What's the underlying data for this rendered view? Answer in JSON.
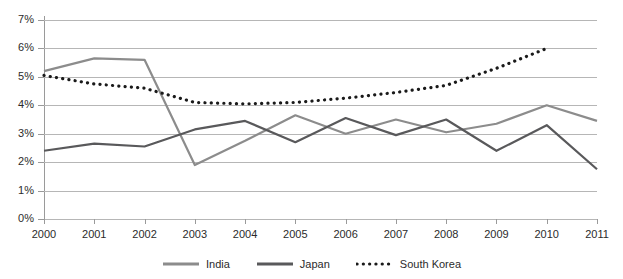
{
  "chart_data": {
    "type": "line",
    "title": "",
    "xlabel": "",
    "ylabel": "",
    "categories": [
      "2000",
      "2001",
      "2002",
      "2003",
      "2004",
      "2005",
      "2006",
      "2007",
      "2008",
      "2009",
      "2010",
      "2011"
    ],
    "x": [
      2000,
      2001,
      2002,
      2003,
      2004,
      2005,
      2006,
      2007,
      2008,
      2009,
      2010,
      2011
    ],
    "ylim": [
      0,
      7
    ],
    "xlim": [
      2000,
      2011
    ],
    "y_tick_labels": [
      "0%",
      "1%",
      "2%",
      "3%",
      "4%",
      "5%",
      "6%",
      "7%"
    ],
    "y_ticks": [
      0,
      1,
      2,
      3,
      4,
      5,
      6,
      7
    ],
    "grid": "horizontal",
    "value_unit": "percent",
    "legend_position": "bottom",
    "series": [
      {
        "name": "India",
        "color": "#8c8c8c",
        "style": "solid",
        "values": [
          5.2,
          5.65,
          5.6,
          1.9,
          2.75,
          3.65,
          3.0,
          3.5,
          3.05,
          3.35,
          4.0,
          3.45
        ]
      },
      {
        "name": "Japan",
        "color": "#59595b",
        "style": "solid",
        "values": [
          2.4,
          2.65,
          2.55,
          3.15,
          3.45,
          2.7,
          3.55,
          2.95,
          3.5,
          2.4,
          3.3,
          1.75
        ]
      },
      {
        "name": "South Korea",
        "color": "#1a1a1a",
        "style": "dotted",
        "values": [
          5.05,
          4.75,
          4.6,
          4.1,
          4.05,
          4.1,
          4.25,
          4.45,
          4.7,
          5.3,
          6.0,
          null
        ]
      }
    ]
  },
  "legend": {
    "items": [
      {
        "label": "India"
      },
      {
        "label": "Japan"
      },
      {
        "label": "South Korea"
      }
    ]
  },
  "colors": {
    "india": "#8c8c8c",
    "japan": "#59595b",
    "south_korea": "#1a1a1a",
    "gridline": "#b6b6b6",
    "axis": "#9a9a9a",
    "background": "#ffffff"
  }
}
